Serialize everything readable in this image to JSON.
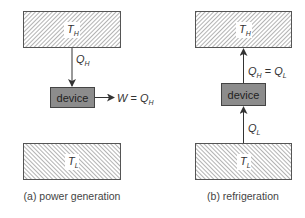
{
  "colors": {
    "reservoir_fill": "#ffffff",
    "hatch": "#8a8a8a",
    "border": "#555555",
    "device_fill": "#8c8c8c",
    "arrow": "#333333"
  },
  "panels": [
    {
      "id": "a",
      "caption": "(a) power generation",
      "hot_reservoir": {
        "symbol": "T",
        "subscript": "H"
      },
      "cold_reservoir": {
        "symbol": "T",
        "subscript": "L"
      },
      "device_label": "device",
      "heat_in_label": {
        "symbol": "Q",
        "subscript": "H"
      },
      "work_label": {
        "lhs": "W",
        "eq": " = ",
        "rhs_symbol": "Q",
        "rhs_subscript": "H"
      }
    },
    {
      "id": "b",
      "caption": "(b) refrigeration",
      "hot_reservoir": {
        "symbol": "T",
        "subscript": "H"
      },
      "cold_reservoir": {
        "symbol": "T",
        "subscript": "L"
      },
      "device_label": "device",
      "heat_out_label": {
        "lhs_symbol": "Q",
        "lhs_subscript": "H",
        "eq": " = ",
        "rhs_symbol": "Q",
        "rhs_subscript": "L"
      },
      "heat_in_label": {
        "symbol": "Q",
        "subscript": "L"
      }
    }
  ]
}
